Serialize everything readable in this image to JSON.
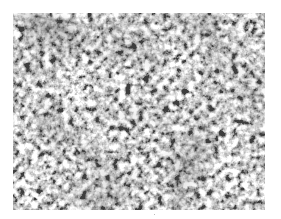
{
  "image": {
    "subject": "grayscale micrograph of metal microstructure",
    "colors": {
      "background": "#ffffff",
      "dark_phase": "#2a2a2a",
      "light_phase": "#e6e6e6"
    }
  }
}
